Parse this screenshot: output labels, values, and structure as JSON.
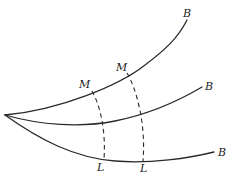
{
  "figure": {
    "curves": [
      {
        "name": "upper",
        "end_label": "B"
      },
      {
        "name": "middle",
        "end_label": "B"
      },
      {
        "name": "lower",
        "end_label": "B"
      }
    ],
    "upper_points": [
      {
        "label": "M"
      },
      {
        "label": "M"
      }
    ],
    "lower_points": [
      {
        "label": "L"
      },
      {
        "label": "L"
      }
    ],
    "connectors": [
      {
        "from": "M",
        "to": "L",
        "style": "dashed"
      },
      {
        "from": "M",
        "to": "L",
        "style": "dashed"
      }
    ],
    "colors": {
      "ink": "#2a2a2a",
      "background": "#ffffff"
    }
  }
}
